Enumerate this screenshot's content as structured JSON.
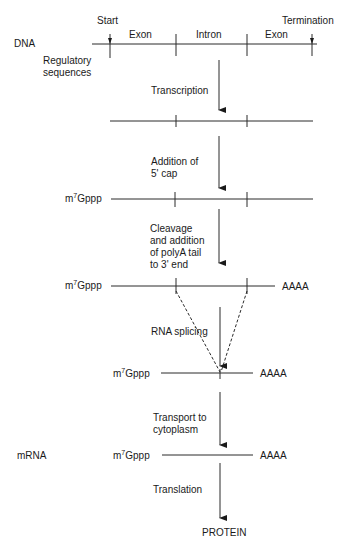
{
  "diagram": {
    "dna": {
      "label": "DNA",
      "start_label": "Start",
      "termination_label": "Termination",
      "segments": [
        "Exon",
        "Intron",
        "Exon"
      ],
      "regulatory_label_line1": "Regulatory",
      "regulatory_label_line2": "sequences"
    },
    "cap_prefix": "m",
    "cap_superscript": "7",
    "cap_suffix": "Gppp",
    "polyA": "AAAA",
    "steps": [
      {
        "id": "transcription",
        "lines": [
          "Transcription"
        ]
      },
      {
        "id": "capping",
        "lines": [
          "Addition of",
          "5' cap"
        ]
      },
      {
        "id": "polyadenylation",
        "lines": [
          "Cleavage",
          "and addition",
          "of polyA tail",
          "to 3' end"
        ]
      },
      {
        "id": "splicing",
        "lines": [
          "RNA splicing"
        ]
      },
      {
        "id": "transport",
        "lines": [
          "Transport to",
          "cytoplasm"
        ]
      },
      {
        "id": "translation",
        "lines": [
          "Translation"
        ]
      }
    ],
    "mrna_label": "mRNA",
    "product_label": "PROTEIN"
  }
}
